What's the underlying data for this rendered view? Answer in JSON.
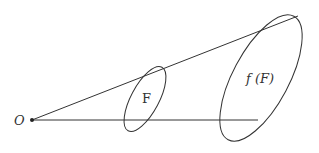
{
  "diagram": {
    "origin_label": "O",
    "set_label": "F",
    "image_label": "f (F)",
    "stroke_color": "#333333",
    "background": "#ffffff"
  }
}
